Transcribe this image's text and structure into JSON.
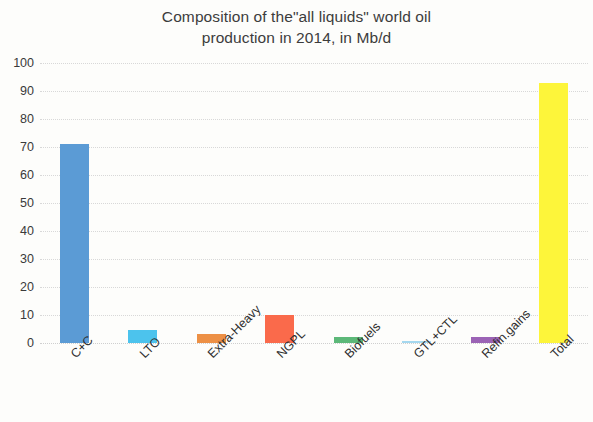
{
  "chart_data": {
    "type": "bar",
    "title": "Composition of the\"all liquids\" world oil\nproduction in 2014, in Mb/d",
    "title_line1": "Composition of the\"all liquids\" world oil",
    "title_line2": "production in 2014, in Mb/d",
    "xlabel": "",
    "ylabel": "",
    "ylim": [
      0,
      100
    ],
    "ytick_step": 10,
    "yticks": [
      100,
      90,
      80,
      70,
      60,
      50,
      40,
      30,
      20,
      10,
      0
    ],
    "grid": true,
    "legend": "none",
    "xtick_rotation": -45,
    "categories": [
      "C+C",
      "LTO",
      "Extra-Heavy",
      "NGPL",
      "Biofuels",
      "GTL+CTL",
      "Refin.gains",
      "Total"
    ],
    "values": [
      71,
      4.5,
      3.2,
      10,
      2.3,
      0.4,
      2.2,
      93
    ],
    "colors": [
      "#5b9bd5",
      "#4cc3ed",
      "#ed9045",
      "#fa6a4b",
      "#5cb878",
      "#a5d8ef",
      "#9b63b5",
      "#fdf53a"
    ],
    "bar_labels": [
      {
        "category": "C+C",
        "value": 71,
        "color": "#5b9bd5"
      },
      {
        "category": "LTO",
        "value": 4.5,
        "color": "#4cc3ed"
      },
      {
        "category": "Extra-Heavy",
        "value": 3.2,
        "color": "#ed9045"
      },
      {
        "category": "NGPL",
        "value": 10,
        "color": "#fa6a4b"
      },
      {
        "category": "Biofuels",
        "value": 2.3,
        "color": "#5cb878"
      },
      {
        "category": "GTL+CTL",
        "value": 0.4,
        "color": "#a5d8ef"
      },
      {
        "category": "Refin.gains",
        "value": 2.2,
        "color": "#9b63b5"
      },
      {
        "category": "Total",
        "value": 93,
        "color": "#fdf53a"
      }
    ]
  }
}
